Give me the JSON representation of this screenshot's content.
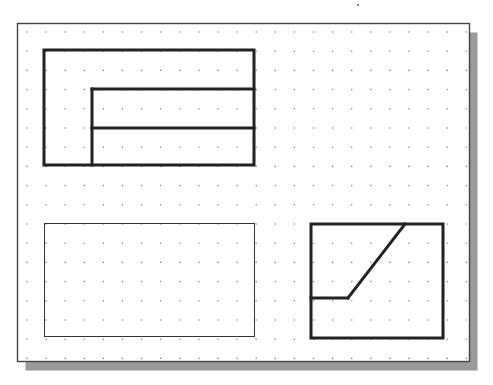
{
  "drawing": {
    "title": "",
    "background": "#ffffff",
    "stray_mark": {
      "x": 358,
      "y": 5,
      "color": "#555555"
    }
  },
  "sheet": {
    "frame": {
      "x": 17.5,
      "y": 23.5,
      "width": 452,
      "height": 338,
      "stroke": "#444444",
      "stroke_width": 1.4,
      "fill": "#ffffff"
    },
    "shadow": {
      "offset_x": 8,
      "offset_y": 9,
      "color": "#9a9a9a"
    },
    "grid": {
      "origin_x": 27,
      "origin_y": 32,
      "pitch_x": 19.1,
      "pitch_y": 19.2,
      "cols": 24,
      "rows": 18,
      "dot_color": "#8c8c8c",
      "dot_radius": 0.8
    }
  },
  "views": [
    {
      "name": "top-left-view",
      "stroke": "#222222",
      "stroke_width": 3,
      "elements": [
        {
          "type": "rect",
          "x": 44,
          "y": 50,
          "width": 210,
          "height": 115
        },
        {
          "type": "line",
          "x1": 92,
          "y1": 89,
          "x2": 254,
          "y2": 89
        },
        {
          "type": "line",
          "x1": 92,
          "y1": 89,
          "x2": 92,
          "y2": 165
        },
        {
          "type": "line",
          "x1": 92,
          "y1": 128,
          "x2": 254,
          "y2": 128
        }
      ]
    },
    {
      "name": "bottom-left-view",
      "stroke": "#333333",
      "stroke_width": 1,
      "elements": [
        {
          "type": "rect",
          "x": 44.5,
          "y": 223.5,
          "width": 210,
          "height": 113
        }
      ]
    },
    {
      "name": "bottom-right-view",
      "stroke": "#222222",
      "stroke_width": 3,
      "elements": [
        {
          "type": "rect",
          "x": 311,
          "y": 224,
          "width": 132,
          "height": 114
        },
        {
          "type": "line",
          "x1": 311,
          "y1": 298,
          "x2": 348,
          "y2": 298
        },
        {
          "type": "line",
          "x1": 348,
          "y1": 298,
          "x2": 405,
          "y2": 224
        }
      ]
    }
  ]
}
